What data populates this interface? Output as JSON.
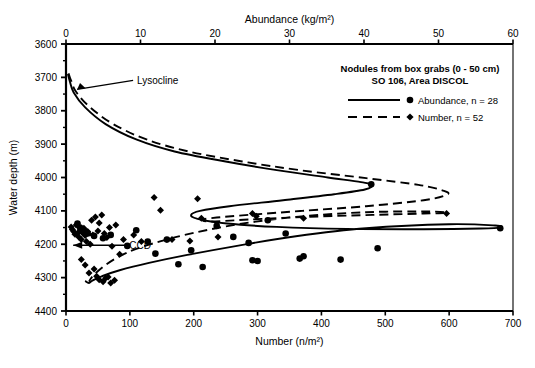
{
  "figure": {
    "title_top_axis": "Abundance (kg/m²)",
    "title_bottom_axis": "Number (n/m²)",
    "title_y_axis": "Water depth (m)"
  },
  "legend": {
    "line1": "Nodules from box grabs (0 - 50 cm)",
    "line2": "SO 106, Area DISCOL",
    "entry_abundance": "Abundance, n = 28",
    "entry_number": "Number, n = 52"
  },
  "annotations": {
    "lysocline": "Lysocline",
    "ccd": "CCD"
  },
  "chart_data": {
    "type": "scatter",
    "title": "",
    "xlabel": "Number (n/m²)",
    "ylabel": "Water depth (m)",
    "x2label": "Abundance (kg/m²)",
    "grid": false,
    "legend_position": "top-right",
    "xlim": [
      0,
      700
    ],
    "x2lim": [
      0,
      60
    ],
    "ylim": [
      4400,
      3600
    ],
    "y_inverted": true,
    "xticks": [
      0,
      100,
      200,
      300,
      400,
      500,
      600,
      700
    ],
    "x2ticks": [
      0,
      10,
      20,
      30,
      40,
      50,
      60
    ],
    "yticks": [
      3600,
      3700,
      3800,
      3900,
      4000,
      4100,
      4200,
      4300,
      4400
    ],
    "ytick_minor_step": 50,
    "annotations": [
      {
        "label": "Lysocline",
        "depth": 3745,
        "x": 8
      },
      {
        "label": "CCD",
        "depth": 4200,
        "x": 5
      }
    ],
    "series": [
      {
        "name": "Abundance, n = 28",
        "marker": "circle",
        "line": "solid",
        "axis": "bottom",
        "count": 28,
        "points": [
          [
            18,
            4138
          ],
          [
            22,
            4150
          ],
          [
            28,
            4160
          ],
          [
            34,
            4168
          ],
          [
            44,
            4175
          ],
          [
            58,
            4182
          ],
          [
            70,
            4172
          ],
          [
            96,
            4205
          ],
          [
            110,
            4158
          ],
          [
            128,
            4192
          ],
          [
            140,
            4228
          ],
          [
            158,
            4186
          ],
          [
            176,
            4260
          ],
          [
            196,
            4218
          ],
          [
            214,
            4268
          ],
          [
            236,
            4145
          ],
          [
            262,
            4178
          ],
          [
            286,
            4196
          ],
          [
            292,
            4248
          ],
          [
            300,
            4250
          ],
          [
            316,
            4128
          ],
          [
            344,
            4168
          ],
          [
            366,
            4243
          ],
          [
            372,
            4236
          ],
          [
            430,
            4246
          ],
          [
            478,
            4020
          ],
          [
            488,
            4212
          ],
          [
            680,
            4152
          ]
        ],
        "curve": [
          [
            3,
            3690
          ],
          [
            6,
            3712
          ],
          [
            12,
            3745
          ],
          [
            30,
            3790
          ],
          [
            62,
            3840
          ],
          [
            110,
            3886
          ],
          [
            170,
            3922
          ],
          [
            250,
            3952
          ],
          [
            330,
            3978
          ],
          [
            410,
            4000
          ],
          [
            462,
            4014
          ],
          [
            480,
            4022
          ],
          [
            468,
            4036
          ],
          [
            420,
            4050
          ],
          [
            340,
            4068
          ],
          [
            256,
            4086
          ],
          [
            210,
            4100
          ],
          [
            196,
            4112
          ],
          [
            206,
            4124
          ],
          [
            252,
            4138
          ],
          [
            330,
            4148
          ],
          [
            440,
            4154
          ],
          [
            560,
            4155
          ],
          [
            650,
            4153
          ],
          [
            680,
            4150
          ],
          [
            672,
            4144
          ],
          [
            600,
            4140
          ],
          [
            470,
            4152
          ],
          [
            360,
            4176
          ],
          [
            270,
            4204
          ],
          [
            190,
            4232
          ],
          [
            130,
            4256
          ],
          [
            84,
            4278
          ],
          [
            56,
            4296
          ],
          [
            42,
            4308
          ],
          [
            36,
            4316
          ],
          [
            30,
            4310
          ]
        ]
      },
      {
        "name": "Number, n = 52",
        "marker": "diamond",
        "line": "dashed",
        "axis": "bottom",
        "count": 52,
        "points": [
          [
            8,
            4148
          ],
          [
            10,
            4156
          ],
          [
            12,
            4162
          ],
          [
            14,
            4170
          ],
          [
            16,
            4142
          ],
          [
            18,
            4168
          ],
          [
            20,
            4178
          ],
          [
            22,
            4158
          ],
          [
            24,
            4186
          ],
          [
            26,
            4166
          ],
          [
            28,
            4152
          ],
          [
            30,
            4174
          ],
          [
            32,
            4192
          ],
          [
            34,
            4162
          ],
          [
            38,
            4200
          ],
          [
            40,
            4128
          ],
          [
            42,
            4172
          ],
          [
            46,
            4118
          ],
          [
            50,
            4160
          ],
          [
            52,
            4136
          ],
          [
            56,
            4112
          ],
          [
            60,
            4168
          ],
          [
            64,
            4180
          ],
          [
            68,
            4150
          ],
          [
            72,
            4206
          ],
          [
            78,
            4142
          ],
          [
            84,
            4230
          ],
          [
            90,
            4186
          ],
          [
            24,
            4246
          ],
          [
            30,
            4262
          ],
          [
            36,
            4286
          ],
          [
            44,
            4274
          ],
          [
            48,
            4296
          ],
          [
            52,
            4306
          ],
          [
            58,
            4312
          ],
          [
            62,
            4302
          ],
          [
            66,
            4298
          ],
          [
            70,
            4316
          ],
          [
            76,
            4308
          ],
          [
            106,
            4172
          ],
          [
            118,
            4192
          ],
          [
            138,
            4060
          ],
          [
            148,
            4098
          ],
          [
            166,
            4186
          ],
          [
            194,
            4190
          ],
          [
            206,
            4064
          ],
          [
            212,
            4122
          ],
          [
            238,
            4178
          ],
          [
            292,
            4108
          ],
          [
            298,
            4116
          ],
          [
            372,
            4122
          ],
          [
            596,
            4108
          ]
        ],
        "curve": [
          [
            4,
            3688
          ],
          [
            8,
            3710
          ],
          [
            16,
            3744
          ],
          [
            38,
            3790
          ],
          [
            74,
            3840
          ],
          [
            126,
            3886
          ],
          [
            192,
            3922
          ],
          [
            276,
            3952
          ],
          [
            366,
            3978
          ],
          [
            470,
            4002
          ],
          [
            552,
            4022
          ],
          [
            592,
            4040
          ],
          [
            596,
            4052
          ],
          [
            560,
            4068
          ],
          [
            470,
            4086
          ],
          [
            370,
            4100
          ],
          [
            286,
            4112
          ],
          [
            236,
            4120
          ],
          [
            214,
            4126
          ],
          [
            226,
            4132
          ],
          [
            286,
            4126
          ],
          [
            380,
            4118
          ],
          [
            480,
            4112
          ],
          [
            560,
            4108
          ],
          [
            596,
            4106
          ],
          [
            570,
            4102
          ],
          [
            470,
            4104
          ],
          [
            360,
            4118
          ],
          [
            270,
            4140
          ],
          [
            200,
            4166
          ],
          [
            150,
            4190
          ],
          [
            110,
            4214
          ],
          [
            82,
            4238
          ],
          [
            62,
            4262
          ],
          [
            48,
            4284
          ],
          [
            40,
            4300
          ],
          [
            36,
            4312
          ]
        ]
      }
    ]
  }
}
